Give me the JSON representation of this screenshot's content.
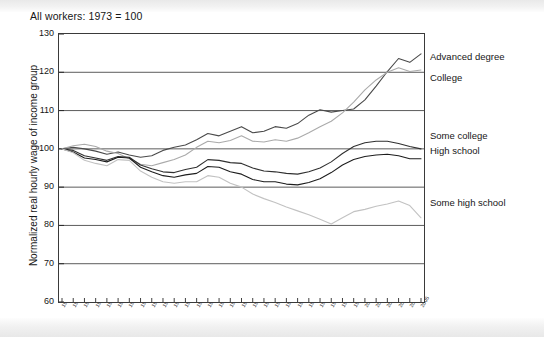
{
  "chart_data": {
    "type": "line",
    "title": "All workers: 1973 = 100",
    "xlabel": "",
    "ylabel": "Normalized real hourly wage of income group",
    "ylim": [
      60,
      130
    ],
    "yticks": [
      60,
      70,
      80,
      90,
      100,
      110,
      120,
      130
    ],
    "grid": true,
    "legend_position": "right-inline",
    "x": [
      1973,
      1974,
      1975,
      1976,
      1977,
      1978,
      1979,
      1980,
      1981,
      1982,
      1983,
      1984,
      1985,
      1986,
      1987,
      1988,
      1989,
      1990,
      1991,
      1992,
      1993,
      1994,
      1995,
      1996,
      1997,
      1998,
      1999,
      2000,
      2001,
      2002,
      2003,
      2004,
      2005
    ],
    "xtick_labels": [
      "1973",
      "1974",
      "1975",
      "1976",
      "1977",
      "1978",
      "1979",
      "1980",
      "1981",
      "1982",
      "1983",
      "1984",
      "1985",
      "1986",
      "1987",
      "1988",
      "1989",
      "1990",
      "1991",
      "1992",
      "1993",
      "1994",
      "1995",
      "1996",
      "1997",
      "1998",
      "1999",
      "2000",
      "2001",
      "2002",
      "2003",
      "2004",
      "2005"
    ],
    "series": [
      {
        "name": "Advanced degree",
        "color": "#4a4a4a",
        "values": [
          100,
          100.4,
          100.0,
          99.4,
          98.6,
          99.2,
          98.4,
          97.8,
          98.2,
          99.6,
          100.4,
          101.0,
          102.4,
          104.0,
          103.4,
          104.6,
          105.8,
          104.2,
          104.6,
          105.8,
          105.4,
          106.6,
          108.8,
          110.2,
          109.6,
          110.0,
          110.4,
          112.8,
          116.4,
          120.2,
          123.6,
          122.6,
          124.8
        ]
      },
      {
        "name": "College",
        "color": "#aaaaaa",
        "values": [
          100,
          100.8,
          101.2,
          100.6,
          99.4,
          98.8,
          97.4,
          96.0,
          95.6,
          96.4,
          97.2,
          98.4,
          100.4,
          102.0,
          101.6,
          102.2,
          103.4,
          102.0,
          101.8,
          102.4,
          102.0,
          102.8,
          104.2,
          105.8,
          107.2,
          109.4,
          112.2,
          115.4,
          118.0,
          120.0,
          121.2,
          120.2,
          120.6
        ]
      },
      {
        "name": "Some college",
        "color": "#303030",
        "values": [
          100,
          99.6,
          98.2,
          97.6,
          97.0,
          98.0,
          97.8,
          95.8,
          94.8,
          94.0,
          93.8,
          94.6,
          95.2,
          97.2,
          97.0,
          96.4,
          96.2,
          95.0,
          94.2,
          94.0,
          93.6,
          93.4,
          94.0,
          95.0,
          96.6,
          98.8,
          100.6,
          101.6,
          102.0,
          102.0,
          101.4,
          100.6,
          100.0
        ]
      },
      {
        "name": "High school",
        "color": "#1d1d1d",
        "values": [
          100,
          99.2,
          97.6,
          97.2,
          96.6,
          97.8,
          97.6,
          95.2,
          94.0,
          93.0,
          92.6,
          93.2,
          93.6,
          95.4,
          95.2,
          94.0,
          93.4,
          92.0,
          91.4,
          91.4,
          90.8,
          90.6,
          91.2,
          92.2,
          93.8,
          95.8,
          97.2,
          98.0,
          98.4,
          98.6,
          98.2,
          97.4,
          97.4
        ]
      },
      {
        "name": "Some high school",
        "color": "#c2c2c2",
        "values": [
          100,
          99.0,
          97.0,
          96.2,
          95.6,
          97.2,
          97.0,
          94.2,
          92.6,
          91.4,
          91.0,
          91.4,
          91.4,
          93.0,
          92.6,
          91.0,
          90.0,
          88.2,
          87.0,
          86.0,
          84.8,
          83.8,
          82.8,
          81.6,
          80.4,
          82.0,
          83.6,
          84.2,
          85.0,
          85.6,
          86.4,
          85.2,
          82.0
        ]
      }
    ],
    "legend_entries": [
      {
        "label": "Advanced degree",
        "top_px": 51
      },
      {
        "label": "College",
        "top_px": 72
      },
      {
        "label": "Some college",
        "top_px": 130
      },
      {
        "label": "High school",
        "top_px": 145
      },
      {
        "label": "Some high school",
        "top_px": 197
      }
    ]
  }
}
